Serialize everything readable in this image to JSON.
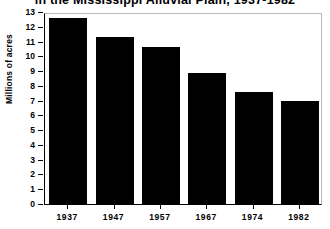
{
  "chart_data": {
    "type": "bar",
    "title": "in the Mississippi Alluvial Plain, 1937-1982",
    "xlabel": "",
    "ylabel": "Millions of acres",
    "categories": [
      "1937",
      "1947",
      "1957",
      "1967",
      "1974",
      "1982"
    ],
    "values": [
      12.6,
      11.3,
      10.6,
      8.9,
      7.6,
      7.0
    ],
    "ylim": [
      0,
      13
    ],
    "ytick_labels": [
      "0",
      "1",
      "2",
      "3",
      "4",
      "5",
      "6",
      "7",
      "8",
      "9",
      "10",
      "11",
      "12",
      "13"
    ],
    "ytick_values": [
      0,
      1,
      2,
      3,
      4,
      5,
      6,
      7,
      8,
      9,
      10,
      11,
      12,
      13
    ],
    "grid": false,
    "legend": null,
    "bar_color": "#000000",
    "axis_color": "#000000",
    "frame_color": "#b9b9b9",
    "background_color": "#ffffff"
  }
}
